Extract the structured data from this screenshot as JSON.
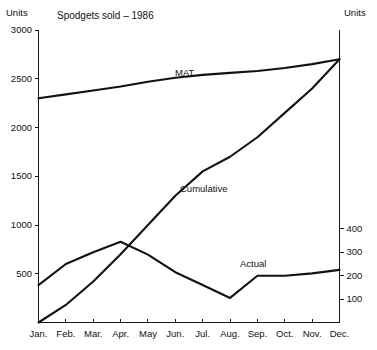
{
  "chart_data": {
    "type": "line",
    "title": "Spodgets sold – 1986",
    "xlabel": "",
    "ylabel": "Units",
    "y2label": "Units",
    "grid": false,
    "legend_position": "inline-annotations",
    "categories": [
      "Jan.",
      "Feb.",
      "Mar.",
      "Apr.",
      "May",
      "Jun.",
      "Jul.",
      "Aug.",
      "Sep.",
      "Oct.",
      "Nov.",
      "Dec."
    ],
    "ylim": [
      0,
      3000
    ],
    "yticks": [
      500,
      1000,
      1500,
      2000,
      2500,
      3000
    ],
    "y2lim": [
      0,
      1250
    ],
    "y2ticks": [
      100,
      200,
      300,
      400
    ],
    "series": [
      {
        "name": "MAT",
        "axis": "left",
        "values": [
          2300,
          2340,
          2380,
          2420,
          2470,
          2510,
          2540,
          2560,
          2580,
          2610,
          2650,
          2700
        ]
      },
      {
        "name": "Cumulative",
        "axis": "left",
        "values": [
          0,
          180,
          420,
          700,
          1000,
          1300,
          1550,
          1700,
          1900,
          2150,
          2400,
          2700
        ]
      },
      {
        "name": "Actual",
        "axis": "right",
        "values": [
          160,
          250,
          300,
          345,
          290,
          215,
          160,
          105,
          200,
          200,
          210,
          225
        ]
      }
    ]
  },
  "axis": {
    "left_title": "Units",
    "right_title": "Units",
    "left_ticks": [
      "3000",
      "2500",
      "2000",
      "1500",
      "1000",
      "500"
    ],
    "right_ticks": [
      "400",
      "300",
      "200",
      "100"
    ]
  },
  "annotations": {
    "mat": "MAT",
    "cumulative": "Cumulative",
    "actual": "Actual"
  }
}
